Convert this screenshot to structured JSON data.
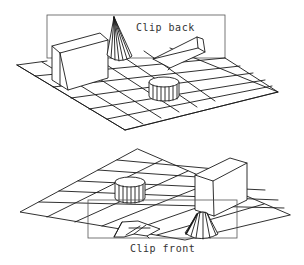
{
  "figure": {
    "top_panel": {
      "label": "Clip back",
      "objects": [
        "grid-floor",
        "box",
        "cone",
        "wedge",
        "cylinder",
        "clip-back-plane"
      ]
    },
    "bottom_panel": {
      "label": "Clip front",
      "objects": [
        "grid-floor",
        "box",
        "cone",
        "wedge",
        "cylinder",
        "clip-front-plane"
      ]
    },
    "colors": {
      "line": "#1a1a1a",
      "clip_plane": "#555555",
      "label": "#333333",
      "background": "#ffffff"
    }
  }
}
